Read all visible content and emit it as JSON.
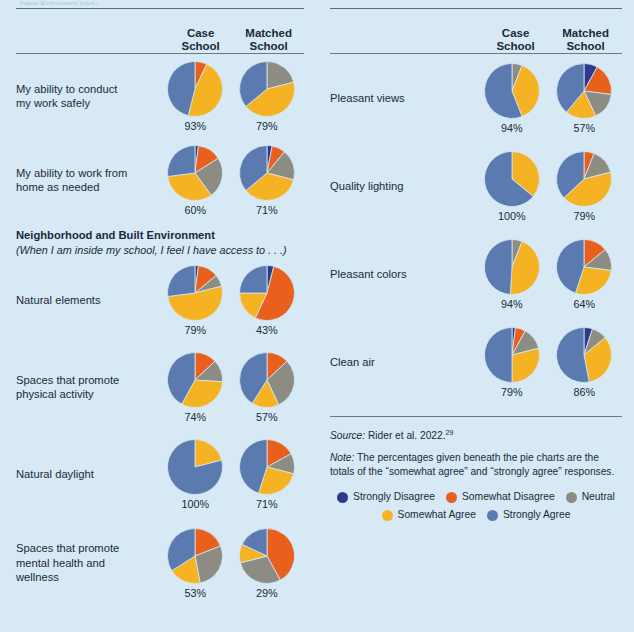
{
  "top_stub": "Indoor Environment (cont.)",
  "columns": {
    "case": "Case\nSchool",
    "case_l1": "Case",
    "case_l2": "School",
    "matched_l1": "Matched",
    "matched_l2": "School"
  },
  "colors": {
    "strongly_disagree": "#2b3a8f",
    "somewhat_disagree": "#e8601c",
    "neutral": "#8c8c83",
    "somewhat_agree": "#f5b324",
    "strongly_agree": "#5a7ab0",
    "background": "#d6e9f5",
    "rule": "#5d6d7a",
    "text": "#1b2a3a"
  },
  "legend": {
    "row1": [
      {
        "label": "Strongly Disagree",
        "color": "#2b3a8f"
      },
      {
        "label": "Somewhat Disagree",
        "color": "#e8601c"
      },
      {
        "label": "Neutral",
        "color": "#8c8c83"
      }
    ],
    "row2": [
      {
        "label": "Somewhat Agree",
        "color": "#f5b324"
      },
      {
        "label": "Strongly Agree",
        "color": "#5a7ab0"
      }
    ]
  },
  "footer": {
    "source_label": "Source:",
    "source_text": " Rider et al. 2022.",
    "source_sup": "29",
    "note_label": "Note:",
    "note_text": " The percentages given beneath the pie charts are the totals of the “somewhat agree” and “strongly agree” responses."
  },
  "section": {
    "title": "Neighborhood and Built Environment",
    "subtitle": "(When I am inside my school, I feel I have access to . . .)"
  },
  "chart_data": {
    "type": "pie",
    "legend_position": "bottom",
    "categories": [
      "Strongly Disagree",
      "Somewhat Disagree",
      "Neutral",
      "Somewhat Agree",
      "Strongly Agree"
    ],
    "colors": [
      "#2b3a8f",
      "#e8601c",
      "#8c8c83",
      "#f5b324",
      "#5a7ab0"
    ],
    "note": "Percentages below each pie = somewhat agree + strongly agree",
    "left_column": [
      {
        "label": "My ability to conduct\nmy work safely",
        "label_l1": "My ability to conduct",
        "label_l2": "my work safely",
        "case": {
          "pct": "93%",
          "values": [
            0,
            7,
            0,
            47,
            46
          ]
        },
        "matched": {
          "pct": "79%",
          "values": [
            0,
            0,
            21,
            43,
            36
          ]
        }
      },
      {
        "label": "My ability to work from\nhome as needed",
        "label_l1": "My ability to work from",
        "label_l2": "home as needed",
        "case": {
          "pct": "60%",
          "values": [
            2,
            14,
            24,
            33,
            27
          ]
        },
        "matched": {
          "pct": "71%",
          "values": [
            3,
            8,
            18,
            35,
            36
          ]
        }
      },
      {
        "label": "Natural elements",
        "label_l1": "Natural elements",
        "label_l2": "",
        "case": {
          "pct": "79%",
          "values": [
            2,
            12,
            7,
            52,
            27
          ]
        },
        "matched": {
          "pct": "43%",
          "values": [
            4,
            53,
            0,
            18,
            25
          ]
        }
      },
      {
        "label": "Spaces that promote\nphysical activity",
        "label_l1": "Spaces that promote",
        "label_l2": "physical activity",
        "case": {
          "pct": "74%",
          "values": [
            0,
            13,
            13,
            32,
            42
          ]
        },
        "matched": {
          "pct": "57%",
          "values": [
            0,
            13,
            30,
            16,
            41
          ]
        }
      },
      {
        "label": "Natural daylight",
        "label_l1": "Natural daylight",
        "label_l2": "",
        "case": {
          "pct": "100%",
          "values": [
            0,
            0,
            0,
            21,
            79
          ]
        },
        "matched": {
          "pct": "71%",
          "values": [
            0,
            17,
            12,
            26,
            45
          ]
        }
      },
      {
        "label": "Spaces that promote\nmental health and\nwellness",
        "label_l1": "Spaces that promote",
        "label_l2": "mental health and",
        "label_l3": "wellness",
        "case": {
          "pct": "53%",
          "values": [
            0,
            19,
            28,
            19,
            34
          ]
        },
        "matched": {
          "pct": "29%",
          "values": [
            0,
            42,
            29,
            11,
            18
          ]
        }
      }
    ],
    "right_column": [
      {
        "label": "Pleasant views",
        "label_l1": "Pleasant views",
        "label_l2": "",
        "case": {
          "pct": "94%",
          "values": [
            0,
            0,
            6,
            38,
            56
          ]
        },
        "matched": {
          "pct": "57%",
          "values": [
            8,
            19,
            16,
            18,
            39
          ]
        }
      },
      {
        "label": "Quality lighting",
        "label_l1": "Quality lighting",
        "label_l2": "",
        "case": {
          "pct": "100%",
          "values": [
            0,
            0,
            0,
            36,
            64
          ]
        },
        "matched": {
          "pct": "79%",
          "values": [
            0,
            6,
            15,
            42,
            37
          ]
        }
      },
      {
        "label": "Pleasant colors",
        "label_l1": "Pleasant colors",
        "label_l2": "",
        "case": {
          "pct": "94%",
          "values": [
            0,
            0,
            6,
            45,
            49
          ]
        },
        "matched": {
          "pct": "64%",
          "values": [
            0,
            14,
            13,
            28,
            45
          ]
        }
      },
      {
        "label": "Clean air",
        "label_l1": "Clean air",
        "label_l2": "",
        "case": {
          "pct": "79%",
          "values": [
            2,
            6,
            13,
            29,
            50
          ]
        },
        "matched": {
          "pct": "86%",
          "values": [
            5,
            0,
            9,
            33,
            53
          ]
        }
      }
    ]
  }
}
